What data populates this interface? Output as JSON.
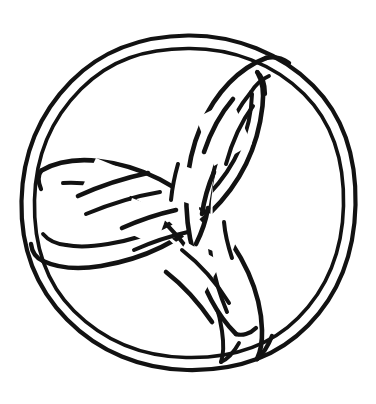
{
  "artwork": {
    "title": "Celtic Triquetra in Circle",
    "subject": "trinity-knot",
    "style": "line-art-coloring-page",
    "medium": "hand-drawn ink outline",
    "background_color": "#ffffff",
    "ink_color": "#121212",
    "band_fill_color": "#ffffff",
    "canvas": {
      "width": 376,
      "height": 404
    }
  },
  "geometry": {
    "circle": {
      "center_x": 188,
      "center_y": 203,
      "outer_radius": 167,
      "inner_radius": 155,
      "stroke_width": 4.2,
      "description": "double-line enclosing ring"
    },
    "knot": {
      "center_x": 186,
      "center_y": 200,
      "lobe_count": 3,
      "rotation_degrees": -30,
      "band_half_width": 14,
      "stroke_width": 4.6,
      "vertices": [
        {
          "name": "upper-right-point",
          "x": 256,
          "y": 72
        },
        {
          "name": "left-point",
          "x": 42,
          "y": 172
        },
        {
          "name": "lower-point",
          "x": 236,
          "y": 332
        }
      ],
      "description": "three interlaced vesica-piscis lobes woven over and under"
    }
  },
  "elements": {
    "outer_ring_label": "outer circle band",
    "lobe_a_label": "upper-right lobe",
    "lobe_b_label": "lower-left lobe",
    "lobe_c_label": "right lobe"
  }
}
